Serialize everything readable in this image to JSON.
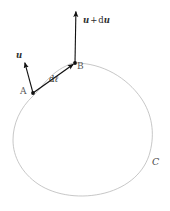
{
  "figure": {
    "background_color": "#ffffff",
    "width": 170,
    "height": 211,
    "curve": {
      "name": "C",
      "label": "C",
      "stroke_color": "#b9b9b9",
      "stroke_width": 0.8,
      "closed": true,
      "fill": "none"
    },
    "points": [
      {
        "id": "A",
        "label": "A",
        "x": 33,
        "y": 93,
        "marker": "filled-dot",
        "color": "#1a1a1a"
      },
      {
        "id": "B",
        "label": "B",
        "x": 75,
        "y": 63,
        "marker": "filled-dot",
        "color": "#1a1a1a"
      }
    ],
    "vectors": [
      {
        "id": "u-at-a",
        "label": "u",
        "label_parts": {
          "symbol": "u",
          "operator": "",
          "differential": ""
        },
        "from": {
          "x": 33,
          "y": 93
        },
        "to": {
          "x": 24,
          "y": 60
        },
        "color": "#111111",
        "arrowhead": true
      },
      {
        "id": "u-plus-du-at-b",
        "label": "u + du",
        "label_parts": {
          "symbol": "u",
          "operator": "+",
          "differential": "d",
          "differential_symbol": "u"
        },
        "from": {
          "x": 75,
          "y": 63
        },
        "to": {
          "x": 76,
          "y": 9
        },
        "color": "#111111",
        "arrowhead": true
      },
      {
        "id": "dl-a-to-b",
        "label": "dℓ",
        "label_parts": {
          "symbol": "ℓ",
          "operator": "",
          "differential": "d"
        },
        "from": {
          "x": 33,
          "y": 93
        },
        "to": {
          "x": 75,
          "y": 63
        },
        "color": "#111111",
        "arrowhead": true
      }
    ],
    "labels": {
      "point_a": "A",
      "point_b": "B",
      "curve_c": "C",
      "vec_u": "u",
      "vec_u_plus_du_prefix": "u",
      "vec_plus": "+",
      "vec_d": "d",
      "vec_du_symbol": "u",
      "vec_dl_d": "d",
      "vec_dl_symbol": "ℓ"
    }
  }
}
